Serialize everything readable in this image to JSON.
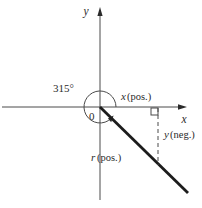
{
  "figure": {
    "angle_label": "315°",
    "origin_label": "0",
    "axes": {
      "x_label": "x",
      "y_label": "y"
    },
    "x_component": {
      "var": "x",
      "qualifier": "(pos.)"
    },
    "y_component": {
      "var": "y",
      "qualifier": "(neg.)"
    },
    "r_component": {
      "var": "r",
      "qualifier": "(pos.)"
    },
    "colors": {
      "thin_line": "#4a4a4a",
      "thick_line": "#1c1c1c",
      "text": "#2b2b2b",
      "background": "#ffffff"
    }
  }
}
